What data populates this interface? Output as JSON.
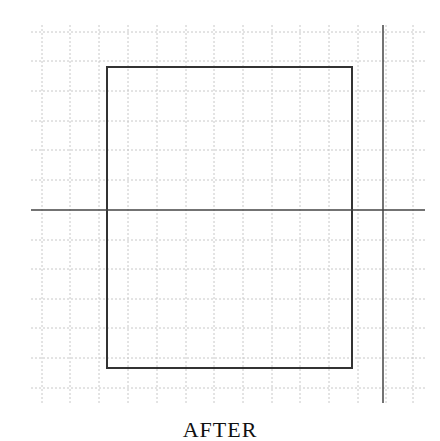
{
  "diagram": {
    "caption": "AFTER",
    "colors": {
      "background": "#ffffff",
      "grid": "#c8c8c8",
      "rectangle": "#333333",
      "axis": "#444444"
    },
    "grid": {
      "x_lines": [
        42,
        70,
        99,
        128,
        157,
        186,
        214,
        243,
        272,
        300,
        329,
        358,
        386,
        413
      ],
      "y_lines": [
        32,
        61,
        91,
        121,
        150,
        180,
        240,
        269,
        299,
        328,
        358,
        388
      ],
      "x_extent": [
        31,
        425
      ],
      "y_extent": [
        25,
        403
      ],
      "style": "dotted"
    },
    "rectangle": {
      "x": 107,
      "y": 67,
      "width": 245,
      "height": 301
    },
    "horizontal_line": {
      "x1": 31,
      "x2": 425,
      "y": 210
    },
    "vertical_line": {
      "x": 383,
      "y1": 25,
      "y2": 403
    }
  }
}
